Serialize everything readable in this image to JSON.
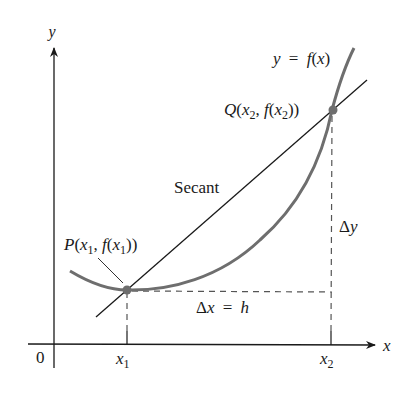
{
  "figure": {
    "type": "secant-line-diagram",
    "labels": {
      "y_axis": "y",
      "x_axis": "x",
      "origin": "0",
      "curve": "y = f(x)",
      "secant": "Secant",
      "point_p": "P(x1, f(x1))",
      "point_q": "Q(x2, f(x2))",
      "delta_x": "Δx = h",
      "delta_y": "Δy",
      "x1_tick": "x1",
      "x2_tick": "x2"
    },
    "parts": {
      "p_name": "P",
      "q_name": "Q",
      "x": "x",
      "f": "f",
      "sub1": "1",
      "sub2": "2",
      "delta": "Δ",
      "h": "h",
      "y": "y",
      "eq": "=",
      "open": "(",
      "close": ")",
      "comma": ", ",
      "close2": "))"
    },
    "colors": {
      "curve": "#6e6e6e",
      "secant": "#1a1a1a",
      "axes": "#1a1a1a",
      "dashed": "#555555",
      "points": "#6e6e6e"
    }
  }
}
